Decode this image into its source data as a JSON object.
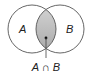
{
  "diagram": {
    "type": "venn",
    "sets": [
      {
        "id": "A",
        "label": "A",
        "cx": 32,
        "cy": 29,
        "r": 24
      },
      {
        "id": "B",
        "label": "B",
        "cx": 60,
        "cy": 29,
        "r": 24
      }
    ],
    "intersection": {
      "label": "A ∩ B",
      "fill": "#bdbdbd"
    },
    "colors": {
      "stroke": "#444444",
      "background": "#ffffff",
      "intersection_fill": "#bdbdbd"
    }
  }
}
